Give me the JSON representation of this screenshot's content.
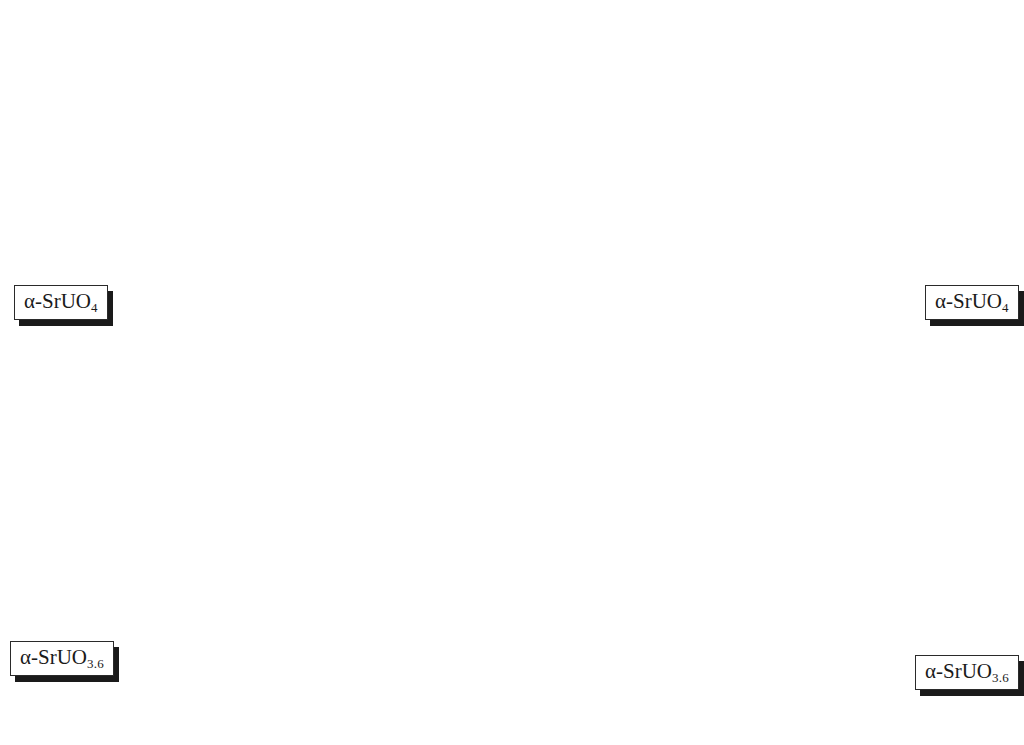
{
  "figure": {
    "kind": "xrd-waterfall",
    "background": "#ffffff",
    "trace_color_cold": "#333333",
    "trace_color_hot": "#ef7a63",
    "frame_color": "#2b2b2b",
    "grid_color": "#d9d9d9"
  },
  "axes": {
    "x": {
      "title_prefix": "2",
      "title_theta": "θ",
      "title_suffix": " (degrees)",
      "title": "2θ (degrees)",
      "ticks": [
        "30",
        "36.6",
        "43.3",
        "50"
      ],
      "tick_values": [
        30,
        36.6,
        43.3,
        50
      ],
      "range": [
        27.5,
        54.0
      ],
      "minor_tick_count": 20
    },
    "y_intensity": {
      "title": "Itensity (a.u)",
      "ticks": [
        "25",
        "2300",
        "4600",
        "6900",
        "9200",
        "11500"
      ],
      "tick_values": [
        25,
        2300,
        4600,
        6900,
        9200,
        11500
      ],
      "range": [
        25,
        11500
      ]
    },
    "z_temperature": {
      "title": "Temperature (°C)",
      "title_main": "Temperature (",
      "title_deg": "o",
      "title_tail": "C)",
      "ticks": [
        "25",
        "150",
        "350",
        "550",
        "750",
        "950"
      ],
      "tick_values": [
        25,
        150,
        350,
        550,
        750,
        950
      ],
      "units": "°C"
    }
  },
  "callouts": [
    {
      "id": "left-top",
      "base": "α-SrUO",
      "sub": "4",
      "full": "α-SrUO4"
    },
    {
      "id": "left-bottom",
      "base": "α-SrUO",
      "sub": "3.6",
      "full": "α-SrUO3.6"
    },
    {
      "id": "right-top",
      "base": "α-SrUO",
      "sub": "4",
      "full": "α-SrUO4"
    },
    {
      "id": "right-bottom",
      "base": "α-SrUO",
      "sub": "3.6",
      "full": "α-SrUO3.6"
    }
  ],
  "arrows": [
    {
      "id": "left-arrow",
      "style": "dashed-down",
      "from": "α-SrUO4",
      "to": "α-SrUO3.6"
    },
    {
      "id": "right-arrow",
      "style": "dashed-down",
      "from": "α-SrUO4",
      "to": "α-SrUO3.6"
    }
  ],
  "chart_data": {
    "type": "line",
    "subtype": "3d-waterfall-stack",
    "title": "",
    "xlabel": "2θ (degrees)",
    "ylabel": "Itensity (a.u)",
    "zlabel": "Temperature (°C)",
    "xlim": [
      27.5,
      54.0
    ],
    "ylim": [
      25,
      11500
    ],
    "grid": true,
    "legend": null,
    "n_traces": 29,
    "trace_temperatures": [
      25,
      50,
      75,
      100,
      125,
      150,
      200,
      250,
      300,
      350,
      400,
      450,
      500,
      550,
      600,
      650,
      700,
      750,
      800,
      850,
      900,
      925,
      950,
      960,
      970,
      980,
      990,
      1000,
      1010
    ],
    "peaks_2theta": [
      30.6,
      32.0,
      34.6,
      38.2,
      40.0,
      42.0,
      43.3,
      46.8,
      50.3,
      52.0
    ],
    "peak_rel_heights": [
      0.92,
      0.22,
      0.12,
      0.09,
      0.13,
      0.16,
      0.14,
      0.13,
      1.0,
      0.58
    ],
    "peak_widths": [
      0.34,
      0.38,
      0.45,
      0.55,
      0.5,
      0.5,
      0.45,
      0.48,
      0.32,
      0.36
    ],
    "series": [
      {
        "name": "25 °C",
        "color": "#333333",
        "comment": "back trace, α-SrUO4"
      },
      {
        "name": "950 °C",
        "color": "#ef7a63",
        "comment": "front trace, α-SrUO3.6"
      }
    ],
    "annotations": [
      {
        "text": "α-SrUO4",
        "position": "top, low temperature"
      },
      {
        "text": "α-SrUO3.6",
        "position": "bottom, high temperature"
      }
    ]
  }
}
